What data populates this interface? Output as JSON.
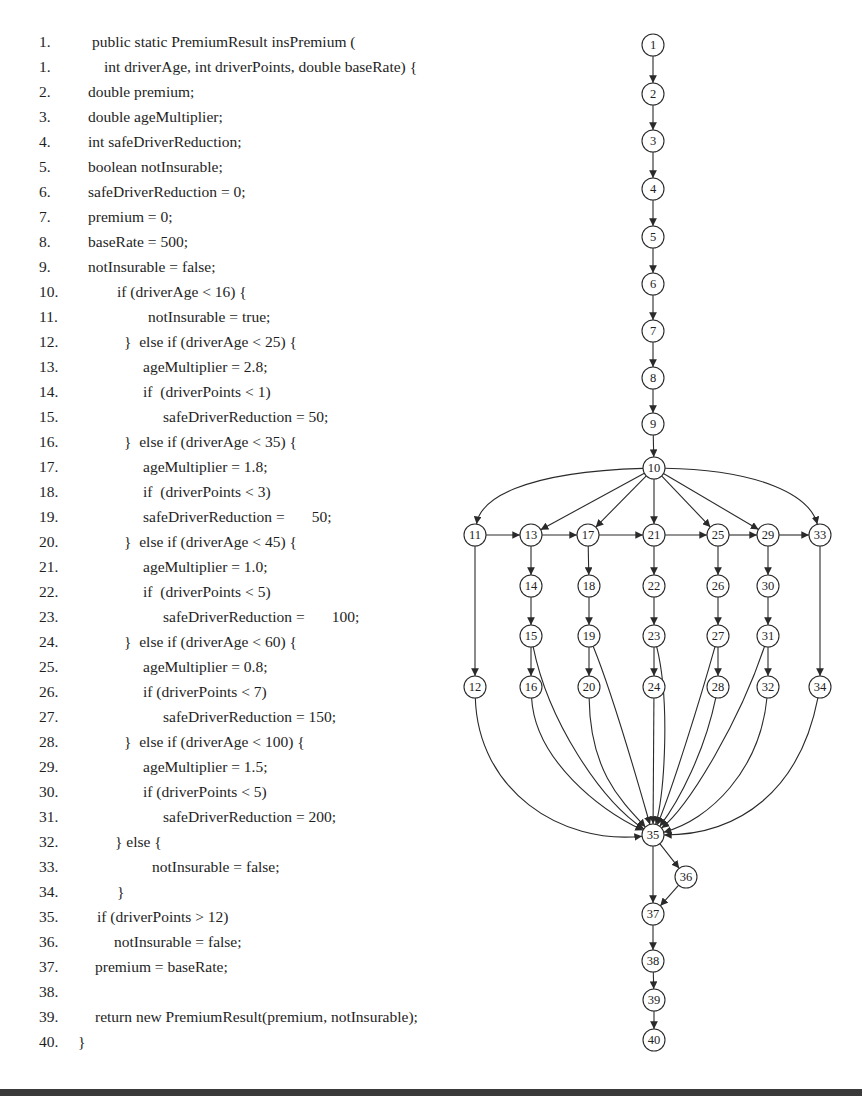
{
  "code": {
    "lines": [
      {
        "num": "1.",
        "indent": 92,
        "text": "public static PremiumResult insPremium ("
      },
      {
        "num": "1.",
        "indent": 104,
        "text": "int driverAge, int driverPoints, double baseRate) {"
      },
      {
        "num": "2.",
        "indent": 88,
        "text": "double premium;"
      },
      {
        "num": "3.",
        "indent": 88,
        "text": "double ageMultiplier;"
      },
      {
        "num": "4.",
        "indent": 88,
        "text": "int safeDriverReduction;"
      },
      {
        "num": "5.",
        "indent": 88,
        "text": "boolean notInsurable;"
      },
      {
        "num": "6.",
        "indent": 88,
        "text": "safeDriverReduction = 0;"
      },
      {
        "num": "7.",
        "indent": 88,
        "text": "premium = 0;"
      },
      {
        "num": "8.",
        "indent": 88,
        "text": "baseRate = 500;"
      },
      {
        "num": "9.",
        "indent": 88,
        "text": "notInsurable = false;"
      },
      {
        "num": "10.",
        "indent": 117,
        "text": "if (driverAge < 16) {"
      },
      {
        "num": "11.",
        "indent": 148,
        "text": "notInsurable = true;"
      },
      {
        "num": "12.",
        "indent": 124,
        "text": "}  else if (driverAge < 25) {"
      },
      {
        "num": "13.",
        "indent": 143,
        "text": "ageMultiplier = 2.8;"
      },
      {
        "num": "14.",
        "indent": 143,
        "text": "if  (driverPoints < 1)"
      },
      {
        "num": "15.",
        "indent": 163,
        "text": "safeDriverReduction = 50;"
      },
      {
        "num": "16.",
        "indent": 124,
        "text": "}  else if (driverAge < 35) {"
      },
      {
        "num": "17.",
        "indent": 143,
        "text": "ageMultiplier = 1.8;"
      },
      {
        "num": "18.",
        "indent": 143,
        "text": "if  (driverPoints < 3)"
      },
      {
        "num": "19.",
        "indent": 143,
        "text": "safeDriverReduction =       50;"
      },
      {
        "num": "20.",
        "indent": 124,
        "text": "}  else if (driverAge < 45) {"
      },
      {
        "num": "21.",
        "indent": 143,
        "text": "ageMultiplier = 1.0;"
      },
      {
        "num": "22.",
        "indent": 143,
        "text": "if  (driverPoints < 5)"
      },
      {
        "num": "23.",
        "indent": 163,
        "text": "safeDriverReduction =       100;"
      },
      {
        "num": "24.",
        "indent": 124,
        "text": "}  else if (driverAge < 60) {"
      },
      {
        "num": "25.",
        "indent": 143,
        "text": "ageMultiplier = 0.8;"
      },
      {
        "num": "26.",
        "indent": 143,
        "text": "if (driverPoints < 7)"
      },
      {
        "num": "27.",
        "indent": 163,
        "text": "safeDriverReduction = 150;"
      },
      {
        "num": "28.",
        "indent": 124,
        "text": "}  else if (driverAge < 100) {"
      },
      {
        "num": "29.",
        "indent": 143,
        "text": "ageMultiplier = 1.5;"
      },
      {
        "num": "30.",
        "indent": 143,
        "text": "if (driverPoints < 5)"
      },
      {
        "num": "31.",
        "indent": 163,
        "text": "safeDriverReduction = 200;"
      },
      {
        "num": "32.",
        "indent": 115,
        "text": "} else {"
      },
      {
        "num": "33.",
        "indent": 152,
        "text": "notInsurable = false;"
      },
      {
        "num": "34.",
        "indent": 117,
        "text": "}"
      },
      {
        "num": "35.",
        "indent": 97,
        "text": "if (driverPoints > 12)"
      },
      {
        "num": "36.",
        "indent": 114,
        "text": "notInsurable = false;"
      },
      {
        "num": "37.",
        "indent": 95,
        "text": "premium = baseRate;"
      },
      {
        "num": "38.",
        "indent": 95,
        "text": ""
      },
      {
        "num": "39.",
        "indent": 95,
        "text": "return new PremiumResult(premium, notInsurable);"
      },
      {
        "num": "40.",
        "indent": 78,
        "text": "}"
      }
    ]
  },
  "graph": {
    "node_radius": 11,
    "nodes": [
      {
        "id": "1",
        "x": 653,
        "y": 45
      },
      {
        "id": "2",
        "x": 653,
        "y": 94
      },
      {
        "id": "3",
        "x": 653,
        "y": 141
      },
      {
        "id": "4",
        "x": 653,
        "y": 189
      },
      {
        "id": "5",
        "x": 653,
        "y": 237
      },
      {
        "id": "6",
        "x": 653,
        "y": 284
      },
      {
        "id": "7",
        "x": 653,
        "y": 331
      },
      {
        "id": "8",
        "x": 653,
        "y": 378
      },
      {
        "id": "9",
        "x": 653,
        "y": 424
      },
      {
        "id": "10",
        "x": 654,
        "y": 468
      },
      {
        "id": "11",
        "x": 475,
        "y": 535
      },
      {
        "id": "13",
        "x": 531,
        "y": 535
      },
      {
        "id": "17",
        "x": 588,
        "y": 535
      },
      {
        "id": "21",
        "x": 654,
        "y": 535
      },
      {
        "id": "25",
        "x": 718,
        "y": 535
      },
      {
        "id": "29",
        "x": 768,
        "y": 535
      },
      {
        "id": "33",
        "x": 820,
        "y": 535
      },
      {
        "id": "14",
        "x": 531,
        "y": 586
      },
      {
        "id": "18",
        "x": 589,
        "y": 586
      },
      {
        "id": "22",
        "x": 654,
        "y": 586
      },
      {
        "id": "26",
        "x": 718,
        "y": 586
      },
      {
        "id": "30",
        "x": 768,
        "y": 586
      },
      {
        "id": "15",
        "x": 531,
        "y": 636
      },
      {
        "id": "19",
        "x": 589,
        "y": 636
      },
      {
        "id": "23",
        "x": 654,
        "y": 636
      },
      {
        "id": "27",
        "x": 718,
        "y": 636
      },
      {
        "id": "31",
        "x": 768,
        "y": 636
      },
      {
        "id": "12",
        "x": 475,
        "y": 687
      },
      {
        "id": "16",
        "x": 531,
        "y": 687
      },
      {
        "id": "20",
        "x": 589,
        "y": 687
      },
      {
        "id": "24",
        "x": 654,
        "y": 687
      },
      {
        "id": "28",
        "x": 718,
        "y": 687
      },
      {
        "id": "32",
        "x": 768,
        "y": 687
      },
      {
        "id": "34",
        "x": 820,
        "y": 687
      },
      {
        "id": "35",
        "x": 653,
        "y": 835
      },
      {
        "id": "36",
        "x": 686,
        "y": 877
      },
      {
        "id": "37",
        "x": 653,
        "y": 914
      },
      {
        "id": "38",
        "x": 653,
        "y": 961
      },
      {
        "id": "39",
        "x": 654,
        "y": 1000
      },
      {
        "id": "40",
        "x": 654,
        "y": 1040
      }
    ],
    "edges": [
      {
        "from": "1",
        "to": "2"
      },
      {
        "from": "2",
        "to": "3"
      },
      {
        "from": "3",
        "to": "4"
      },
      {
        "from": "4",
        "to": "5"
      },
      {
        "from": "5",
        "to": "6"
      },
      {
        "from": "6",
        "to": "7"
      },
      {
        "from": "7",
        "to": "8"
      },
      {
        "from": "8",
        "to": "9"
      },
      {
        "from": "9",
        "to": "10"
      },
      {
        "from": "10",
        "to": "11",
        "curve": [
          520,
          472,
          480,
          500
        ]
      },
      {
        "from": "10",
        "to": "13"
      },
      {
        "from": "10",
        "to": "17"
      },
      {
        "from": "10",
        "to": "21"
      },
      {
        "from": "10",
        "to": "25"
      },
      {
        "from": "10",
        "to": "29"
      },
      {
        "from": "10",
        "to": "33",
        "curve": [
          760,
          470,
          810,
          495
        ]
      },
      {
        "from": "11",
        "to": "13"
      },
      {
        "from": "13",
        "to": "17"
      },
      {
        "from": "17",
        "to": "21"
      },
      {
        "from": "21",
        "to": "25"
      },
      {
        "from": "25",
        "to": "29"
      },
      {
        "from": "29",
        "to": "33"
      },
      {
        "from": "11",
        "to": "12"
      },
      {
        "from": "13",
        "to": "14"
      },
      {
        "from": "14",
        "to": "15"
      },
      {
        "from": "15",
        "to": "16"
      },
      {
        "from": "17",
        "to": "18"
      },
      {
        "from": "18",
        "to": "19"
      },
      {
        "from": "19",
        "to": "20"
      },
      {
        "from": "21",
        "to": "22"
      },
      {
        "from": "22",
        "to": "23"
      },
      {
        "from": "23",
        "to": "24"
      },
      {
        "from": "25",
        "to": "26"
      },
      {
        "from": "26",
        "to": "27"
      },
      {
        "from": "27",
        "to": "28"
      },
      {
        "from": "29",
        "to": "30"
      },
      {
        "from": "30",
        "to": "31"
      },
      {
        "from": "31",
        "to": "32"
      },
      {
        "from": "33",
        "to": "34"
      },
      {
        "from": "12",
        "to": "35",
        "curve": [
          478,
          790,
          560,
          845
        ]
      },
      {
        "from": "16",
        "to": "35",
        "curve": [
          535,
          760,
          600,
          810
        ]
      },
      {
        "from": "15",
        "to": "35",
        "curve": [
          548,
          720,
          600,
          800
        ]
      },
      {
        "from": "20",
        "to": "35",
        "curve": [
          590,
          770,
          620,
          800
        ]
      },
      {
        "from": "19",
        "to": "35",
        "curve": [
          615,
          700,
          640,
          790
        ]
      },
      {
        "from": "24",
        "to": "35"
      },
      {
        "from": "23",
        "to": "35",
        "curve": [
          670,
          700,
          665,
          790
        ]
      },
      {
        "from": "27",
        "to": "35",
        "curve": [
          700,
          700,
          672,
          790
        ]
      },
      {
        "from": "28",
        "to": "35",
        "curve": [
          705,
          750,
          680,
          800
        ]
      },
      {
        "from": "31",
        "to": "35",
        "curve": [
          740,
          720,
          690,
          805
        ]
      },
      {
        "from": "32",
        "to": "35",
        "curve": [
          760,
          770,
          710,
          820
        ]
      },
      {
        "from": "34",
        "to": "35",
        "curve": [
          800,
          790,
          740,
          835
        ]
      },
      {
        "from": "35",
        "to": "36"
      },
      {
        "from": "35",
        "to": "37"
      },
      {
        "from": "36",
        "to": "37"
      },
      {
        "from": "37",
        "to": "38"
      },
      {
        "from": "38",
        "to": "39"
      },
      {
        "from": "39",
        "to": "40"
      }
    ]
  },
  "colors": {
    "text": "#1e1e1e",
    "stroke": "#2a2a2a",
    "bar": "#3a3a3a"
  }
}
